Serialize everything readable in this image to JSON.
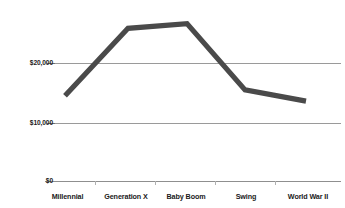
{
  "chart_data": {
    "type": "line",
    "title": "",
    "subtitle": "",
    "xlabel": "",
    "ylabel": "",
    "categories": [
      "Millennial",
      "Generation X",
      "Baby Boom",
      "Swing",
      "World War II"
    ],
    "values": [
      14500,
      26000,
      26800,
      15500,
      13600
    ],
    "series": [
      {
        "name": "",
        "values": [
          14500,
          26000,
          26800,
          15500,
          13600
        ],
        "color": "#4a4a4a"
      }
    ],
    "ylim": [
      0,
      30000
    ],
    "y_ticks": [
      0,
      10000,
      20000
    ],
    "y_tick_labels": [
      "$0",
      "$10,000",
      "$20,000"
    ],
    "grid": true,
    "grid_axis": "y",
    "legend": false,
    "legend_position": "none"
  },
  "axes": {
    "y_labels": [
      {
        "text": "$20,000",
        "value": 20000
      },
      {
        "text": "$10,000",
        "value": 10000
      },
      {
        "text": "$0",
        "value": 0
      }
    ],
    "x_labels": [
      {
        "text": "Millennial"
      },
      {
        "text": "Generation X"
      },
      {
        "text": "Baby Boom"
      },
      {
        "text": "Swing"
      },
      {
        "text": "World War II"
      }
    ]
  },
  "colors": {
    "line": "#4a4a4a",
    "gridline": "#9a9a9a",
    "baseline": "#9a9a9a",
    "tick": "#b0b0b0",
    "text": "#1a1a1a",
    "background": "#ffffff"
  }
}
